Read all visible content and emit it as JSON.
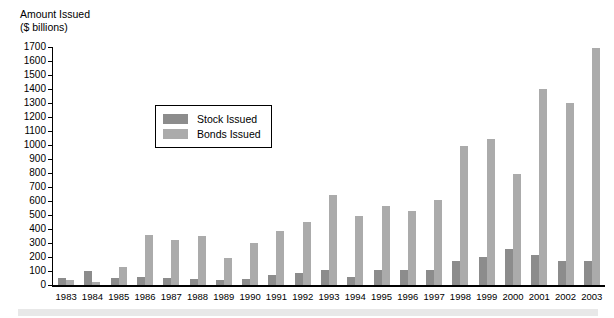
{
  "chart_data": {
    "type": "bar",
    "title": "",
    "ylabel": "Amount Issued ($ billions)",
    "ylabel_lines": [
      "Amount Issued",
      "($ billions)"
    ],
    "xlabel": "",
    "ylim": [
      0,
      1700
    ],
    "ytick_step": 100,
    "yticks": [
      0,
      100,
      200,
      300,
      400,
      500,
      600,
      700,
      800,
      900,
      1000,
      1100,
      1200,
      1300,
      1400,
      1500,
      1600,
      1700
    ],
    "grid": false,
    "legend_position": "inside-upper-left",
    "categories": [
      "1983",
      "1984",
      "1985",
      "1986",
      "1987",
      "1988",
      "1989",
      "1990",
      "1991",
      "1992",
      "1993",
      "1994",
      "1995",
      "1996",
      "1997",
      "1998",
      "1999",
      "2000",
      "2001",
      "2002",
      "2003"
    ],
    "series": [
      {
        "name": "Stock Issued",
        "color": "#8c8c8c",
        "values": [
          50,
          100,
          50,
          55,
          50,
          40,
          35,
          40,
          70,
          85,
          110,
          60,
          105,
          110,
          110,
          175,
          200,
          260,
          215,
          175,
          170
        ]
      },
      {
        "name": "Bonds Issued",
        "color": "#ababab",
        "values": [
          35,
          25,
          130,
          360,
          320,
          350,
          195,
          300,
          385,
          450,
          640,
          490,
          565,
          530,
          605,
          990,
          1040,
          790,
          1400,
          1300,
          1690
        ]
      }
    ]
  },
  "legend": {
    "items": [
      {
        "label": "Stock Issued",
        "color": "#8c8c8c"
      },
      {
        "label": "Bonds Issued",
        "color": "#ababab"
      }
    ]
  },
  "colors": {
    "stock": "#8c8c8c",
    "bonds": "#ababab",
    "axis": "#000000",
    "background": "#ffffff",
    "footer_band": "#e8e8e8"
  }
}
